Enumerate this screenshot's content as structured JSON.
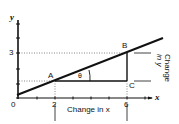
{
  "diagram": {
    "axes": {
      "x_label": "x",
      "y_label": "y",
      "origin_label": "0",
      "x_ticks_labeled": [
        "2",
        "6"
      ],
      "y_ticks_labeled": [
        "3"
      ]
    },
    "points": {
      "A": {
        "label": "A",
        "x": 2,
        "y": 1.2
      },
      "B": {
        "label": "B",
        "x": 6,
        "y": 3
      },
      "C": {
        "label": "C",
        "x": 6,
        "y": 1.2
      }
    },
    "angle_label": "θ",
    "annotations": {
      "change_in_x": "Change in x",
      "change_in_y_line1": "Change",
      "change_in_y_line2": "in y"
    },
    "colors": {
      "line": "#111111",
      "dotted": "#555555",
      "background": "#ffffff"
    }
  }
}
